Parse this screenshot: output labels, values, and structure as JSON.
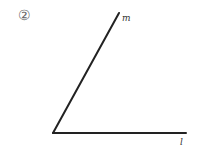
{
  "problem": {
    "number": "②"
  },
  "diagram": {
    "type": "angle",
    "vertex": [
      53,
      133
    ],
    "lines": [
      {
        "name": "m",
        "label": "m",
        "end": [
          119,
          13
        ],
        "label_pos": [
          122,
          21
        ]
      },
      {
        "name": "l",
        "label": "l",
        "end": [
          186,
          133
        ],
        "label_pos": [
          180,
          145
        ]
      }
    ],
    "stroke_color": "#222222"
  }
}
